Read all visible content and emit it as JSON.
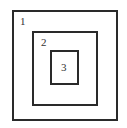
{
  "diagram": {
    "type": "nested-squares",
    "boxes": [
      {
        "label": "1",
        "left": 12,
        "top": 10,
        "width": 106,
        "height": 111
      },
      {
        "label": "2",
        "left": 32,
        "top": 31,
        "width": 66,
        "height": 75
      },
      {
        "label": "3",
        "left": 50,
        "top": 50,
        "width": 29,
        "height": 35
      }
    ],
    "labels": [
      "1",
      "2",
      "3"
    ],
    "line_color": "#2a2a2a"
  }
}
